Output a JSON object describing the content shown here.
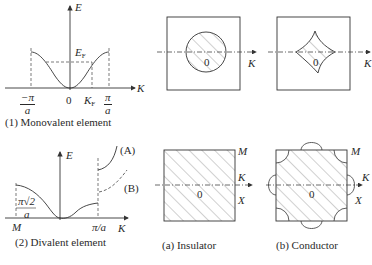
{
  "panel1": {
    "axis_e": "E",
    "axis_k": "K",
    "fermi_energy": "E",
    "fermi_energy_sub": "F",
    "fermi_k": "K",
    "fermi_k_sub": "F",
    "neg_pi_num": "−π",
    "neg_pi_den": "a",
    "origin": "0",
    "pi_num": "π",
    "pi_den": "a",
    "caption": "(1) Monovalent element"
  },
  "panel2": {
    "axis_e": "E",
    "axis_k": "K",
    "label_m": "M",
    "label_pi_a": "π/a",
    "label_pi_sqrt2_num": "π√2",
    "label_pi_sqrt2_den": "a",
    "band_a": "(A)",
    "band_b": "(B)",
    "caption": "(2) Divalent element"
  },
  "fermi_circle": {
    "origin": "0",
    "axis_k": "K"
  },
  "fermi_diamond": {
    "origin": "0",
    "axis_k": "K"
  },
  "insulator": {
    "origin": "0",
    "axis_k": "K",
    "label_m": "M",
    "label_x": "X",
    "caption": "(a) Insulator"
  },
  "conductor": {
    "origin": "0",
    "axis_k": "K",
    "label_m": "M",
    "label_x": "X",
    "caption": "(b) Conductor"
  },
  "colors": {
    "line": "#3a3a3a",
    "hatch": "#6a6a6a",
    "background": "#ffffff"
  }
}
